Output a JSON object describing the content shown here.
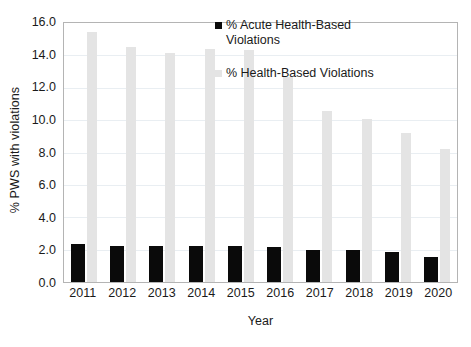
{
  "chart_data": {
    "type": "bar",
    "title": "",
    "xlabel": "Year",
    "ylabel": "% PWS with violations",
    "categories": [
      "2011",
      "2012",
      "2013",
      "2014",
      "2015",
      "2016",
      "2017",
      "2018",
      "2019",
      "2020"
    ],
    "series": [
      {
        "name": "% Acute Health-Based Violations",
        "color": "#0a0a0a",
        "values": [
          2.35,
          2.25,
          2.25,
          2.2,
          2.2,
          2.15,
          1.95,
          1.95,
          1.85,
          1.55
        ]
      },
      {
        "name": "% Health-Based Violations",
        "color": "#e4e4e4",
        "values": [
          15.45,
          14.5,
          14.15,
          14.4,
          14.35,
          12.65,
          10.55,
          10.1,
          9.2,
          8.2
        ]
      }
    ],
    "ylim": [
      0,
      16
    ],
    "ytick_step": 2,
    "yticks": [
      "16.0",
      "14.0",
      "12.0",
      "10.0",
      "8.0",
      "6.0",
      "4.0",
      "2.0",
      "0.0"
    ],
    "grid": true,
    "legend_position": "top-right"
  },
  "legend": {
    "entries": [
      {
        "label": "% Acute Health-Based Violations",
        "color": "#0a0a0a"
      },
      {
        "label": "% Health-Based Violations",
        "color": "#e4e4e4"
      }
    ]
  }
}
